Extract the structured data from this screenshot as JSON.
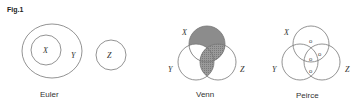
{
  "figure": {
    "label": "Fig.1",
    "shade_color": "#8c8c8c",
    "line_color": "#777777"
  },
  "euler": {
    "caption": "Euler",
    "labels": {
      "x": "X",
      "y": "Y",
      "z": "Z"
    }
  },
  "venn": {
    "caption": "Venn",
    "labels": {
      "x": "X",
      "y": "Y",
      "z": "Z"
    },
    "shaded_regions": [
      "X only",
      "X∩Z (not Y)",
      "X∩Y∩Z",
      "Y∩Z (not X)"
    ]
  },
  "peirce": {
    "caption": "Peirce",
    "labels": {
      "x": "X",
      "y": "Y",
      "z": "Z"
    },
    "marker": "o",
    "marked_regions": [
      "X only",
      "X∩Y∩Z",
      "X∩Z (not Y)",
      "Y∩Z (not X)"
    ]
  }
}
